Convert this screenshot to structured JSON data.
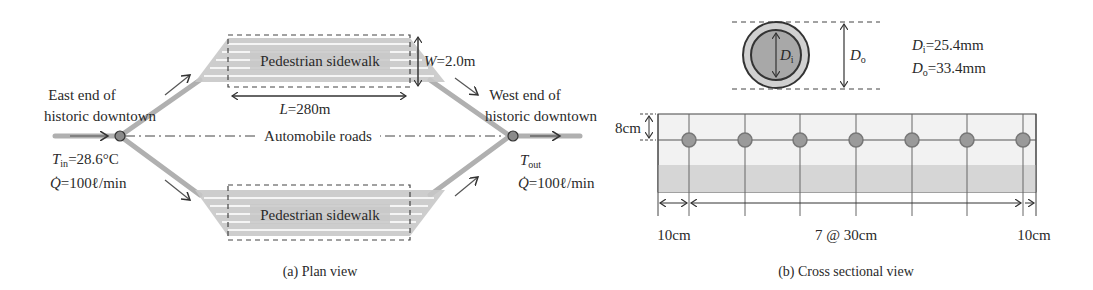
{
  "plan_view": {
    "caption": "(a) Plan view",
    "sidewalk_top_label": "Pedestrian sidewalk",
    "sidewalk_bottom_label": "Pedestrian sidewalk",
    "roads_label": "Automobile roads",
    "east_end_line1": "East end of",
    "east_end_line2": "historic downtown",
    "west_end_line1": "West end of",
    "west_end_line2": "historic downtown",
    "width_label": {
      "symbol": "W",
      "value": "=2.0m"
    },
    "length_label": {
      "symbol": "L",
      "value": "=280m"
    },
    "inlet": {
      "temp_symbol": "T",
      "temp_sub": "in",
      "temp_value": "=28.6°C",
      "flow_symbol": "Q̇",
      "flow_value": "=100ℓ/min"
    },
    "outlet": {
      "temp_symbol": "T",
      "temp_sub": "out",
      "flow_symbol": "Q̇",
      "flow_value": "=100ℓ/min"
    }
  },
  "cross_section": {
    "caption": "(b) Cross sectional view",
    "pipe_inner_symbol": "D",
    "pipe_inner_sub": "i",
    "pipe_outer_symbol": "D",
    "pipe_outer_sub": "o",
    "inner_diameter": {
      "symbol": "D",
      "sub": "i",
      "value": "=25.4mm"
    },
    "outer_diameter": {
      "symbol": "D",
      "sub": "o",
      "value": "=33.4mm"
    },
    "depth_label": "8cm",
    "spacing_left": "10cm",
    "spacing_middle": "7 @ 30cm",
    "spacing_right": "10cm",
    "pipe_count": 7
  },
  "colors": {
    "line": "#555555",
    "pipe_fill": "#9a9a9a",
    "sidewalk_fill": "#c8c8c8",
    "slab_top": "#f2f2f2",
    "slab_band": "#d6d6d6",
    "road_stroke": "#b0b0b0"
  }
}
